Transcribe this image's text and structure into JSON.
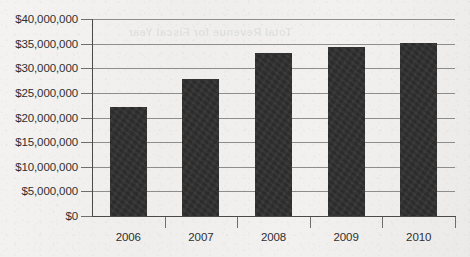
{
  "chart_data": {
    "type": "bar",
    "title": "",
    "xlabel": "",
    "ylabel": "",
    "categories": [
      "2006",
      "2007",
      "2008",
      "2009",
      "2010"
    ],
    "values": [
      22200000,
      27800000,
      33100000,
      34400000,
      35200000
    ],
    "ylim": [
      0,
      40000000
    ],
    "ytick_values": [
      0,
      5000000,
      10000000,
      15000000,
      20000000,
      25000000,
      30000000,
      35000000,
      40000000
    ],
    "ytick_labels": [
      "$0",
      "$5,000,000",
      "$10,000,000",
      "$15,000,000",
      "$20,000,000",
      "$25,000,000",
      "$30,000,000",
      "$35,000,000",
      "$40,000,000"
    ],
    "grid": true,
    "legend": false,
    "legend_position": "none",
    "bar_color": "#2c2c2c",
    "background_color": "#f1f0ee",
    "gridline_color": "#8d8d8d",
    "axis_color": "#4a4a4a"
  },
  "page": {
    "bleed_through_text": "Total Revenue for Fiscal Year"
  }
}
